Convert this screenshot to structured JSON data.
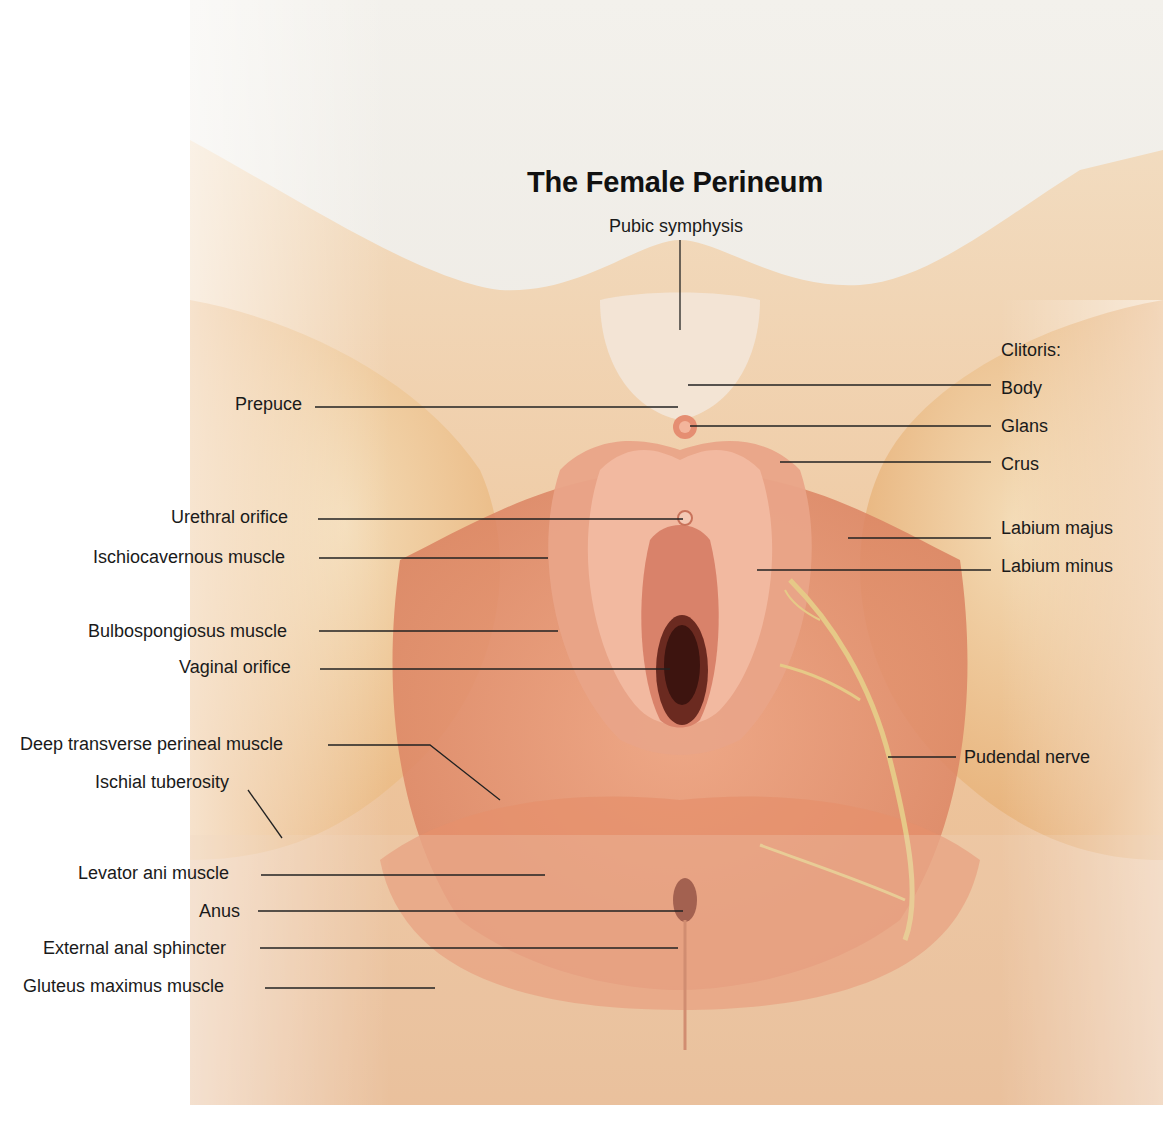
{
  "title": "The Female Perineum",
  "labels": {
    "top": [
      {
        "text": "Pubic symphysis"
      }
    ],
    "left": [
      {
        "text": "Prepuce"
      },
      {
        "text": "Urethral orifice"
      },
      {
        "text": "Ischiocavernous muscle"
      },
      {
        "text": "Bulbospongiosus muscle"
      },
      {
        "text": "Vaginal orifice"
      },
      {
        "text": "Deep transverse perineal muscle"
      },
      {
        "text": "Ischial tuberosity"
      },
      {
        "text": "Levator ani muscle"
      },
      {
        "text": "Anus"
      },
      {
        "text": "External anal sphincter"
      },
      {
        "text": "Gluteus maximus muscle"
      }
    ],
    "right": [
      {
        "text": "Clitoris:"
      },
      {
        "text": "Body"
      },
      {
        "text": "Glans"
      },
      {
        "text": "Crus"
      },
      {
        "text": "Labium majus"
      },
      {
        "text": "Labium minus"
      },
      {
        "text": "Pudendal nerve"
      }
    ]
  },
  "colors": {
    "skin_light": "#f1d9b8",
    "skin_mid": "#e8b784",
    "muscle": "#e59a78",
    "muscle_dark": "#cf7458",
    "nerve": "#e6c987",
    "text": "#1a1a1a"
  }
}
